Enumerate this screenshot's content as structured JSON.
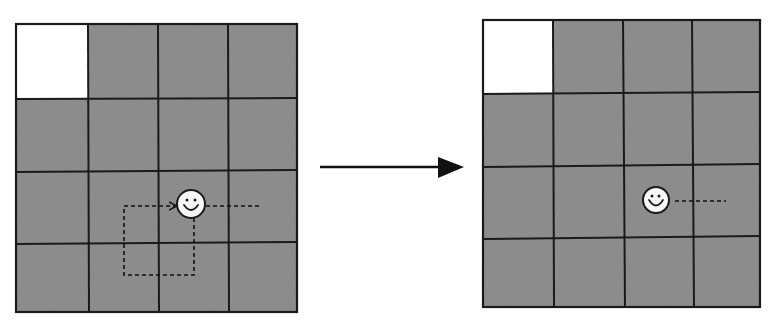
{
  "diagram": {
    "colors": {
      "cell_fill": "#8f8f8f",
      "goal_cell_fill": "#ffffff",
      "grid_line": "#1a1a1a",
      "agent_fill": "#f7f7f7",
      "arrow": "#111111"
    },
    "left_grid": {
      "rows": 4,
      "cols": 4,
      "x": 16,
      "y": 24,
      "width": 281,
      "height": 288,
      "white_cell": {
        "row": 0,
        "col": 0
      },
      "agent": {
        "cx": 191,
        "cy": 204,
        "r": 14,
        "cell": {
          "row": 2,
          "col": 2
        }
      },
      "trail": "loop path: down, left, up, right into agent; dashed continuation to the right"
    },
    "right_grid": {
      "rows": 4,
      "cols": 4,
      "x": 483,
      "y": 20,
      "width": 277,
      "height": 287,
      "white_cell": {
        "row": 0,
        "col": 0
      },
      "agent": {
        "cx": 656,
        "cy": 200,
        "r": 13,
        "cell": {
          "row": 2,
          "col": 2
        }
      },
      "trail": "dashed line continuing to the right"
    },
    "transition_arrow": {
      "from": [
        320,
        167
      ],
      "to": [
        463,
        167
      ],
      "direction": "right"
    }
  }
}
